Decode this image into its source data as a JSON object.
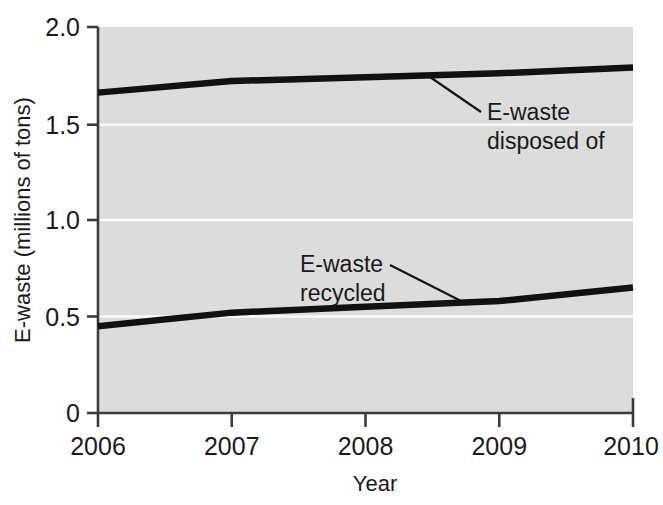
{
  "chart_data": {
    "type": "line",
    "title": "",
    "subtitle": "",
    "xlabel": "Year",
    "ylabel": "E-waste (millions of tons)",
    "x": [
      2006,
      2007,
      2008,
      2009,
      2010
    ],
    "xtick_labels": [
      "2006",
      "2007",
      "2008",
      "2009",
      "2010"
    ],
    "ytick_labels": [
      "0",
      "0.5",
      "1.0",
      "1.5",
      "2.0"
    ],
    "ytick_values": [
      0,
      0.5,
      1.0,
      1.5,
      2.0
    ],
    "xlim": [
      2006,
      2010
    ],
    "ylim": [
      0,
      2.0
    ],
    "grid": "horizontal-white-gridlines",
    "legend": "none-inline-annotations",
    "plot_background": "#dcdcdc",
    "line_color": "#111111",
    "series": [
      {
        "name": "E-waste disposed of",
        "values": [
          1.66,
          1.72,
          1.74,
          1.76,
          1.79
        ]
      },
      {
        "name": "E-waste recycled",
        "values": [
          0.45,
          0.52,
          0.55,
          0.58,
          0.65
        ]
      }
    ],
    "annotations": [
      {
        "label_line1": "E-waste",
        "label_line2": "disposed of",
        "points_to_series": "E-waste disposed of"
      },
      {
        "label_line1": "E-waste",
        "label_line2": "recycled",
        "points_to_series": "E-waste recycled"
      }
    ]
  },
  "axis": {
    "y_title": "E-waste (millions of tons)",
    "x_title": "Year",
    "yticks": [
      {
        "label": "2.0"
      },
      {
        "label": "1.5"
      },
      {
        "label": "1.0"
      },
      {
        "label": "0.5"
      },
      {
        "label": "0"
      }
    ],
    "xticks": [
      {
        "label": "2006"
      },
      {
        "label": "2007"
      },
      {
        "label": "2008"
      },
      {
        "label": "2009"
      },
      {
        "label": "2010"
      }
    ]
  },
  "annotations": {
    "disposed": {
      "line1": "E-waste",
      "line2": "disposed of"
    },
    "recycled": {
      "line1": "E-waste",
      "line2": "recycled"
    }
  }
}
